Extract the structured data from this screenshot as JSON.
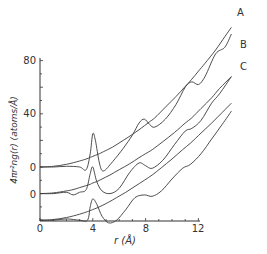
{
  "chart_data": {
    "type": "line",
    "title": "",
    "xlabel": "r (Å)",
    "ylabel": "4πr²ng(r) (atoms/Å)",
    "xlim": [
      0,
      14.5
    ],
    "ylim": [
      -40,
      95
    ],
    "x_ticks": [
      0,
      4,
      8,
      12
    ],
    "y_ticks": [
      {
        "value": 80,
        "label": "80"
      },
      {
        "value": 40,
        "label": "40"
      },
      {
        "value": 0,
        "label": "0",
        "curve": "A"
      },
      {
        "value": -20,
        "label": "0",
        "curve": "B"
      },
      {
        "value": -40,
        "label": "0",
        "curve": "C"
      }
    ],
    "grid": false,
    "legend": "inline labels at upper right of each curve",
    "note": "Curves B and C are offset vertically (baseline of B at -20, C at -40 relative to A's zero). Each curve is paired with smooth parabola 4πr²n.",
    "series": [
      {
        "name": "A",
        "offset": 0,
        "x": [
          0,
          1,
          2,
          3,
          3.5,
          3.8,
          4.0,
          4.2,
          4.5,
          4.8,
          5.5,
          6.3,
          7.0,
          7.5,
          7.9,
          8.3,
          8.7,
          9.5,
          10.3,
          11.0,
          11.5,
          12.0,
          12.5,
          13.3,
          14.0,
          14.5
        ],
        "values": [
          0,
          0,
          0.5,
          0,
          -2,
          10,
          25,
          20,
          3,
          -3,
          4,
          14,
          24,
          33,
          36,
          32,
          30,
          36,
          47,
          60,
          64,
          62,
          68,
          85,
          90,
          100
        ],
        "smooth_values": [
          0,
          0.5,
          2,
          4.5,
          6,
          7.2,
          8,
          8.8,
          10,
          11.5,
          15,
          20,
          24.5,
          28,
          31,
          34,
          37,
          45,
          53,
          60.5,
          66,
          72,
          78,
          88,
          98,
          105
        ]
      },
      {
        "name": "B",
        "offset": -20,
        "x": [
          0,
          1,
          2,
          2.5,
          3,
          3.5,
          3.8,
          4.0,
          4.3,
          4.7,
          5.3,
          6.0,
          6.8,
          7.5,
          8.0,
          8.5,
          9.3,
          10.2,
          11.0,
          11.5,
          12.2,
          13.0,
          13.6,
          14.5
        ],
        "values": [
          0,
          0,
          1,
          -1,
          1,
          3,
          15,
          20,
          9,
          2,
          0,
          4,
          16,
          23,
          21,
          19,
          25,
          37,
          47,
          49,
          55,
          68,
          75,
          88
        ],
        "smooth_values": [
          0,
          0.5,
          2,
          3,
          4.5,
          6,
          7,
          8,
          9,
          11,
          14,
          18,
          22.5,
          27,
          30,
          33,
          39,
          46,
          53,
          57,
          64,
          72,
          79,
          88
        ]
      },
      {
        "name": "C",
        "offset": -40,
        "x": [
          0,
          1,
          2,
          3,
          3.6,
          3.8,
          4.0,
          4.3,
          4.7,
          5.2,
          5.8,
          6.5,
          7.2,
          7.9,
          8.5,
          9.2,
          10.0,
          10.8,
          11.4,
          12.2,
          13.0,
          13.8,
          14.5
        ],
        "values": [
          0,
          0,
          1,
          0,
          0,
          10,
          16,
          12,
          3,
          -2,
          0,
          8,
          17,
          19,
          18,
          22,
          31,
          39,
          42,
          50,
          61,
          72,
          82
        ],
        "smooth_values": [
          0,
          0.5,
          2,
          4.5,
          6.5,
          7.2,
          8,
          9.2,
          11,
          13.5,
          17,
          21,
          25.5,
          30,
          34,
          39.5,
          46,
          53,
          58,
          65.5,
          73,
          81,
          88
        ]
      }
    ],
    "labels": {
      "x_axis_title": "r (Å)",
      "y_axis_title": "4πr²ng(r) (atoms/Å)",
      "curve_A": "A",
      "curve_B": "B",
      "curve_C": "C",
      "y80": "80",
      "y40": "40",
      "y0A": "0",
      "y0B": "0",
      "y0C": "0",
      "x0": "0",
      "x4": "4",
      "x8": "8",
      "x12": "12"
    }
  }
}
